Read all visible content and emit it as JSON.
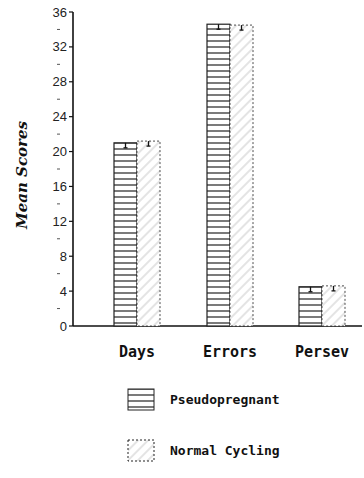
{
  "chart_data": {
    "type": "bar",
    "title": "",
    "xlabel": "",
    "ylabel": "Mean Scores",
    "ylim": [
      0,
      36
    ],
    "yticks": [
      0,
      4,
      8,
      12,
      16,
      20,
      24,
      28,
      32,
      36
    ],
    "grid": false,
    "legend_position": "bottom",
    "categories": [
      "Days",
      "Errors",
      "Persev"
    ],
    "series": [
      {
        "name": "Pseudopregnant",
        "pattern": "horizontal-lines",
        "values": [
          21.0,
          34.6,
          4.5
        ]
      },
      {
        "name": "Normal Cycling",
        "pattern": "diagonal-hatch",
        "values": [
          21.2,
          34.5,
          4.6
        ]
      }
    ],
    "error_bars": "small, shown at top of each bar"
  },
  "legend": {
    "items": [
      {
        "label": "Pseudopregnant"
      },
      {
        "label": "Normal Cycling"
      }
    ]
  }
}
